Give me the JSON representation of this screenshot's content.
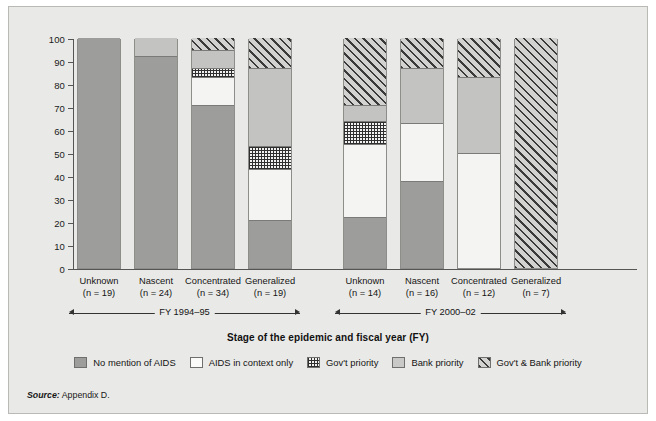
{
  "axis": {
    "y_title": "Percent of countries",
    "y_ticks": [
      "100",
      "90",
      "80",
      "70",
      "60",
      "50",
      "40",
      "30",
      "20",
      "10",
      "0"
    ],
    "x_title": "Stage of the epidemic and fiscal year (FY)"
  },
  "groups": [
    {
      "label": "FY 1994–95"
    },
    {
      "label": "FY 2000–02"
    }
  ],
  "bars": [
    {
      "name": "Unknown",
      "n": "(n = 19)"
    },
    {
      "name": "Nascent",
      "n": "(n = 24)"
    },
    {
      "name": "Concentrated",
      "n": "(n = 34)"
    },
    {
      "name": "Generalized",
      "n": "(n = 19)"
    },
    {
      "name": "Unknown",
      "n": "(n = 14)"
    },
    {
      "name": "Nascent",
      "n": "(n = 16)"
    },
    {
      "name": "Concentrated",
      "n": "(n = 12)"
    },
    {
      "name": "Generalized",
      "n": "(n = 7)"
    }
  ],
  "legend": [
    {
      "key": "none",
      "label": "No mention of AIDS"
    },
    {
      "key": "context",
      "label": "AIDS in context only"
    },
    {
      "key": "gov",
      "label": "Gov't priority"
    },
    {
      "key": "bank",
      "label": "Bank priority"
    },
    {
      "key": "both",
      "label": "Gov't & Bank priority"
    }
  ],
  "source_prefix": "Source:",
  "source_text": "Appendix D.",
  "colors": {
    "no_mention": "#9d9d9b",
    "context": "#f4f4f2",
    "gov": "#f2f2f0",
    "bank": "#c3c3c1",
    "both": "#d2d2d0",
    "background": "#e9e9e7"
  },
  "chart_data": {
    "type": "bar",
    "title": "",
    "xlabel": "Stage of the epidemic and fiscal year (FY)",
    "ylabel": "Percent of countries",
    "ylim": [
      0,
      100
    ],
    "ytick_step": 10,
    "grid": false,
    "stacked": true,
    "legend_position": "bottom",
    "categories": [
      "Unknown (n = 19)",
      "Nascent (n = 24)",
      "Concentrated (n = 34)",
      "Generalized (n = 19)",
      "Unknown (n = 14)",
      "Nascent (n = 16)",
      "Concentrated (n = 12)",
      "Generalized (n = 7)"
    ],
    "group_labels": [
      "FY 1994–95",
      "FY 2000–02"
    ],
    "group_spans": [
      [
        0,
        3
      ],
      [
        4,
        7
      ]
    ],
    "series": [
      {
        "name": "No mention of AIDS",
        "values": [
          100,
          92,
          71,
          21,
          22,
          38,
          0,
          0
        ]
      },
      {
        "name": "AIDS in context only",
        "values": [
          0,
          0,
          12,
          22,
          32,
          25,
          50,
          0
        ]
      },
      {
        "name": "Gov't priority",
        "values": [
          0,
          0,
          4,
          10,
          10,
          0,
          0,
          0
        ]
      },
      {
        "name": "Bank priority",
        "values": [
          0,
          8,
          8,
          34,
          7,
          24,
          33,
          0
        ]
      },
      {
        "name": "Gov't & Bank priority",
        "values": [
          0,
          0,
          5,
          13,
          29,
          13,
          17,
          100
        ]
      }
    ]
  }
}
